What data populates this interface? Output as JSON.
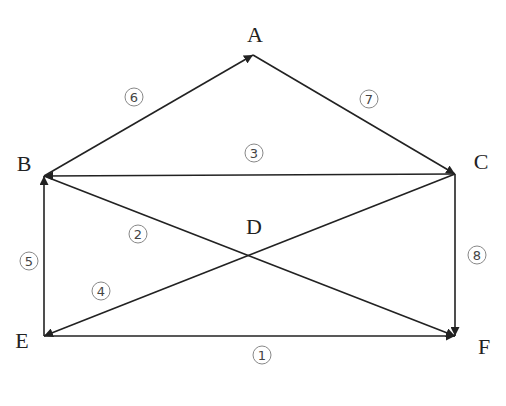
{
  "diagram": {
    "type": "directed-graph",
    "nodes": [
      {
        "id": "A",
        "label": "A",
        "x": 253,
        "y": 55,
        "lx": 255,
        "ly": 37
      },
      {
        "id": "B",
        "label": "B",
        "x": 44,
        "y": 176,
        "lx": 24,
        "ly": 166
      },
      {
        "id": "C",
        "label": "C",
        "x": 455,
        "y": 174,
        "lx": 481,
        "ly": 164
      },
      {
        "id": "D",
        "label": "D",
        "x": 248,
        "y": 254,
        "lx": 254,
        "ly": 229
      },
      {
        "id": "E",
        "label": "E",
        "x": 44,
        "y": 336,
        "lx": 22,
        "ly": 343
      },
      {
        "id": "F",
        "label": "F",
        "x": 455,
        "y": 336,
        "lx": 484,
        "ly": 349
      }
    ],
    "edges": [
      {
        "id": "1",
        "badge": "1",
        "from": "E",
        "to": "F",
        "bx": 262,
        "by": 355
      },
      {
        "id": "2",
        "badge": "2",
        "from": "B",
        "to": "F",
        "bx": 138,
        "by": 234
      },
      {
        "id": "3",
        "badge": "3",
        "from": "C",
        "to": "B",
        "bx": 254,
        "by": 153
      },
      {
        "id": "4",
        "badge": "4",
        "from": "C",
        "to": "E",
        "bx": 101,
        "by": 291
      },
      {
        "id": "5",
        "badge": "5",
        "from": "E",
        "to": "B",
        "bx": 29,
        "by": 261
      },
      {
        "id": "6",
        "badge": "6",
        "from": "B",
        "to": "A",
        "bx": 134,
        "by": 97
      },
      {
        "id": "7",
        "badge": "7",
        "from": "A",
        "to": "C",
        "bx": 369,
        "by": 99
      },
      {
        "id": "8",
        "badge": "8",
        "from": "C",
        "to": "F",
        "bx": 477,
        "by": 255
      }
    ],
    "colors": {
      "line": "#222222",
      "badge_stroke": "#888888",
      "text": "#222222"
    }
  }
}
